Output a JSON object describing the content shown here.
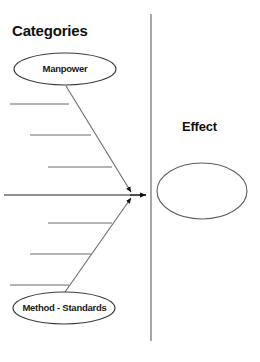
{
  "diagram": {
    "type": "fishbone-ishikawa",
    "background_color": "#ffffff",
    "line_color": "#6b6b6b",
    "arrow_color": "#111111",
    "text_color": "#111111",
    "headings": {
      "categories": "Categories",
      "effect": "Effect"
    },
    "divider": {
      "name": "vertical-divider",
      "x": 151,
      "y_top": 14,
      "y_bottom": 341
    },
    "spine": {
      "name": "main-spine-arrow",
      "x_start": 4,
      "x_end": 146,
      "y": 195
    },
    "categories": [
      {
        "label": "Manpower",
        "position": "top",
        "ellipse": {
          "cx": 65,
          "cy": 69,
          "rx": 51,
          "ry": 16
        },
        "sub_bones": [
          {
            "x_start": 10,
            "x_end": 69,
            "y": 104
          },
          {
            "x_start": 30,
            "x_end": 91,
            "y": 135
          },
          {
            "x_start": 48,
            "x_end": 112,
            "y": 167
          }
        ]
      },
      {
        "label": "Method - Standards",
        "position": "bottom",
        "ellipse": {
          "cx": 64,
          "cy": 308,
          "rx": 51,
          "ry": 16
        },
        "sub_bones": [
          {
            "x_start": 48,
            "x_end": 112,
            "y": 223
          },
          {
            "x_start": 30,
            "x_end": 91,
            "y": 254
          },
          {
            "x_start": 10,
            "x_end": 69,
            "y": 285
          }
        ]
      }
    ],
    "effect_node": {
      "name": "effect-ellipse",
      "cx": 202,
      "cy": 191,
      "rx": 45,
      "ry": 28
    }
  }
}
